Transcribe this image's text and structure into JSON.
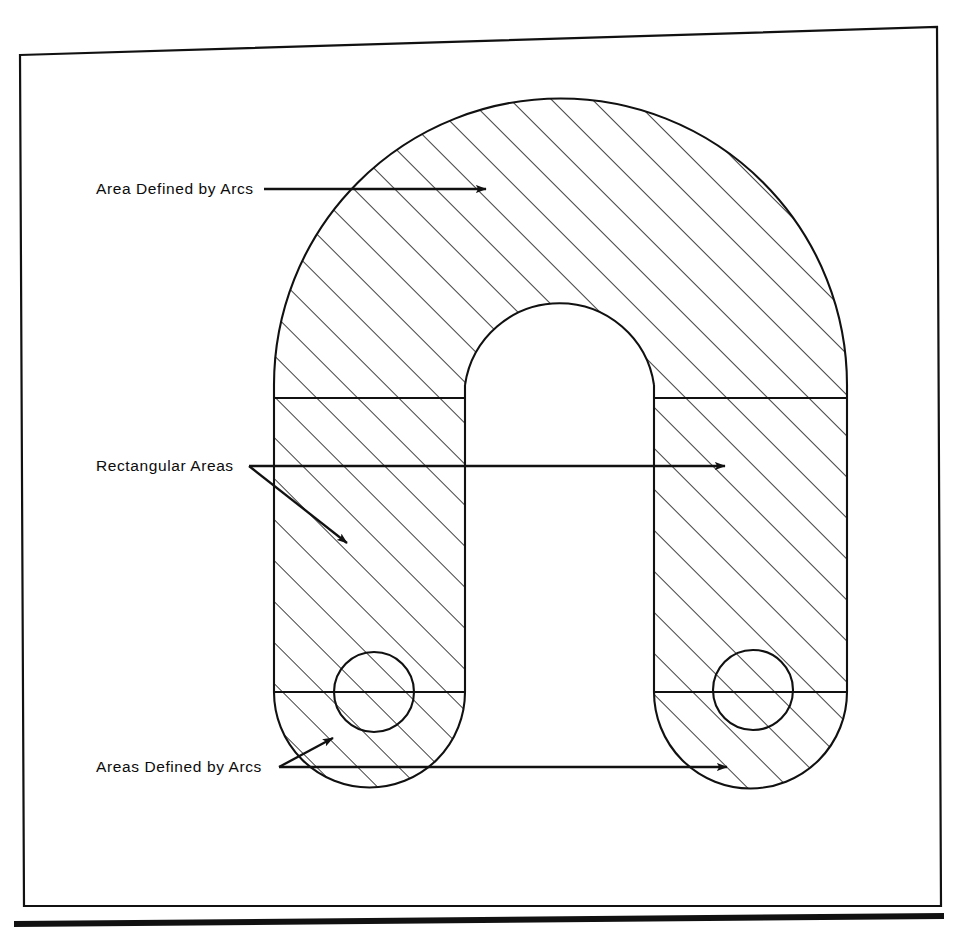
{
  "figure": {
    "background_color": "#ffffff",
    "line_color": "#111111",
    "hatch_color": "#111111",
    "frame": {
      "name": "page-border",
      "stroke_width": 2.2,
      "bottom_rule_stroke_width": 6
    },
    "labels": [
      {
        "id": "area-defined-by-arcs",
        "text": "Area Defined by Arcs",
        "x": 96,
        "y": 193,
        "anchor": "start"
      },
      {
        "id": "rectangular-areas",
        "text": "Rectangular Areas",
        "x": 96,
        "y": 470,
        "anchor": "start"
      },
      {
        "id": "areas-defined-by-arcs",
        "text": "Areas Defined by Arcs",
        "x": 96,
        "y": 771,
        "anchor": "start"
      }
    ],
    "leaders": [
      {
        "id": "leader-top",
        "from": [
          264,
          189
        ],
        "to": [
          492,
          189
        ],
        "arrow": true
      },
      {
        "id": "leader-middle-horizontal",
        "from": [
          249,
          466
        ],
        "to": [
          731,
          466
        ],
        "arrow": true
      },
      {
        "id": "leader-middle-diagonal",
        "from": [
          249,
          466
        ],
        "to": [
          352,
          546
        ],
        "arrow": true
      },
      {
        "id": "leader-bottom-horizontal",
        "from": [
          279,
          767
        ],
        "to": [
          733,
          767
        ],
        "arrow": true
      },
      {
        "id": "leader-bottom-diagonal",
        "from": [
          279,
          767
        ],
        "to": [
          338,
          735
        ],
        "arrow": true
      }
    ],
    "geometry": {
      "outer_left_x": 274,
      "outer_right_x": 847,
      "outer_arch_center_y": 385,
      "outer_arch_top_y": 99,
      "inner_left_x": 465,
      "inner_right_x": 656,
      "inner_arch_top_y": 295,
      "upper_division_y": 398,
      "lower_division_y": 692,
      "bottom_arc_bottom_y": 788,
      "hole_left_center": [
        374,
        692
      ],
      "hole_right_center": [
        753,
        690
      ],
      "hole_radius": 40,
      "hatch_angle_deg": 45,
      "hatch_spacing": 29
    }
  }
}
